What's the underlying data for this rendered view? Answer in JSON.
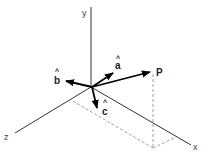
{
  "diagram": {
    "type": "3d-coordinate-system",
    "axes": [
      {
        "name": "y",
        "label": "y"
      },
      {
        "name": "z",
        "label": "z"
      },
      {
        "name": "x",
        "label": "x"
      }
    ],
    "unit_vectors": [
      {
        "name": "a",
        "label": "a",
        "hat": "^"
      },
      {
        "name": "b",
        "label": "b",
        "hat": "^"
      },
      {
        "name": "c",
        "label": "c",
        "hat": "^"
      }
    ],
    "point": {
      "label": "P"
    },
    "colors": {
      "axis": "#333333",
      "vector": "#000000",
      "dashed": "#888888",
      "background": "#ffffff"
    }
  }
}
